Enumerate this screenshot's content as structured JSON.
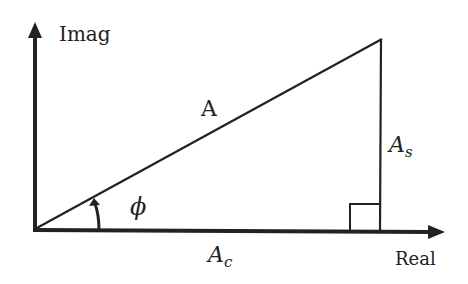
{
  "diagram": {
    "type": "phasor-triangle",
    "axes": {
      "y_label": "Imag",
      "x_label": "Real"
    },
    "hypotenuse_label": "A",
    "adjacent_label": {
      "base": "A",
      "sub": "c"
    },
    "opposite_label": {
      "base": "A",
      "sub": "s"
    },
    "angle_label": "ϕ",
    "right_angle_marker": true,
    "colors": {
      "stroke": "#222222",
      "background": "#ffffff"
    }
  }
}
